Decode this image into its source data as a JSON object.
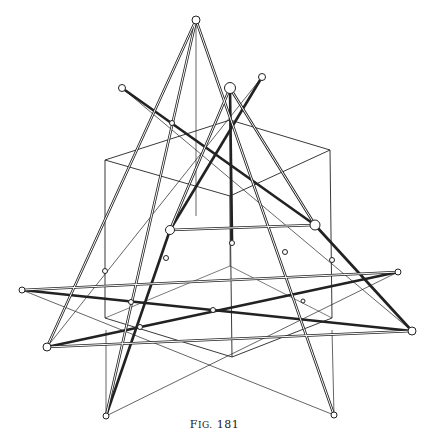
{
  "figure": {
    "caption_prefix_cap": "F",
    "caption_prefix_rest": "IG.",
    "caption_number": "181",
    "stroke_color": "#222222",
    "background": "#ffffff"
  },
  "nodes": {
    "apex_top": [
      196,
      20
    ],
    "apex_big": [
      230,
      88
    ],
    "top_right_small": [
      262,
      77
    ],
    "top_left_small": [
      122,
      88
    ],
    "tri_left": [
      170,
      230
    ],
    "tri_right": [
      315,
      225
    ],
    "far_left_upper": [
      22,
      290
    ],
    "far_left_lower": [
      47,
      347
    ],
    "far_right_upper": [
      398,
      272
    ],
    "far_right_lower": [
      412,
      331
    ],
    "bottom_left": [
      106,
      416
    ],
    "bottom_right": [
      334,
      415
    ]
  }
}
